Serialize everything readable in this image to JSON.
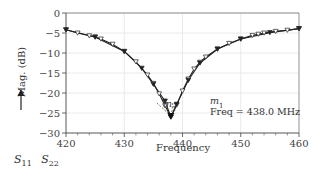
{
  "chart_data": {
    "type": "line",
    "title": "",
    "xlabel": "Frequency",
    "ylabel": "Mag. (dB)",
    "xlim": [
      420,
      460
    ],
    "ylim": [
      -30,
      0
    ],
    "x_ticks": [
      420,
      430,
      440,
      450,
      460
    ],
    "y_ticks": [
      0,
      -5,
      -10,
      -15,
      -20,
      -25,
      -30
    ],
    "grid": true,
    "series": [
      {
        "name": "S11",
        "marker": "triangle-down-open",
        "x": [
          420,
          422,
          424,
          425,
          426,
          428,
          430,
          432,
          434,
          435,
          436,
          437,
          438,
          439,
          440,
          441,
          442,
          443,
          444,
          446,
          448,
          450,
          452,
          453,
          454,
          456,
          458,
          460
        ],
        "y": [
          -4.2,
          -5.0,
          -5.7,
          -6.0,
          -6.5,
          -7.8,
          -9.6,
          -12.2,
          -15.5,
          -17.6,
          -20.2,
          -23.2,
          -26.0,
          -23.0,
          -19.5,
          -16.5,
          -14.0,
          -12.3,
          -11.0,
          -9.0,
          -7.6,
          -6.5,
          -5.6,
          -5.3,
          -5.0,
          -4.6,
          -4.3,
          -3.9
        ]
      },
      {
        "name": "S22",
        "marker": "triangle-down-filled",
        "x": [
          420,
          425,
          430,
          433,
          435,
          437,
          438,
          439,
          441,
          443,
          446,
          450,
          455,
          460
        ],
        "y": [
          -4.2,
          -6.0,
          -9.6,
          -13.8,
          -17.8,
          -22.0,
          -26.0,
          -22.8,
          -16.8,
          -12.5,
          -9.0,
          -6.5,
          -4.9,
          -3.9
        ]
      }
    ],
    "annotations": [
      {
        "label": "m1",
        "x": 438.0,
        "y": -26.0,
        "text": "Freq = 438.0 MHz"
      }
    ],
    "legend": [
      "S11",
      "S22"
    ],
    "legend_position": "bottom-left"
  },
  "labels": {
    "ylabel": "Mag. (dB)",
    "xlabel": "Frequency",
    "marker_name": "m",
    "marker_sub": "1",
    "marker_freq": "Freq = 438.0 MHz",
    "legend_s": "S",
    "legend_s11_sub": "11",
    "legend_s22_sub": "22",
    "x_ticks": [
      "420",
      "430",
      "440",
      "450",
      "460"
    ],
    "y_ticks": [
      "0",
      "−5",
      "−10",
      "−15",
      "−20",
      "−25",
      "−30"
    ]
  }
}
